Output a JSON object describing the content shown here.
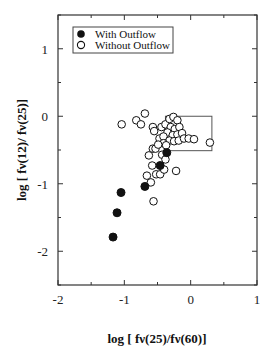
{
  "chart_data": {
    "type": "scatter",
    "title": "",
    "xlabel": "log [ fν(25)/fν(60)]",
    "ylabel": "log [ fν(12)/ fν(25)]",
    "xlim": [
      -2,
      1
    ],
    "ylim": [
      -2.5,
      1.5
    ],
    "xticks": [
      -2,
      -1,
      0,
      1
    ],
    "yticks": [
      -2,
      -1,
      0,
      1
    ],
    "grid": false,
    "legend_position": "upper left",
    "legend": [
      "With Outflow",
      "Without Outflow"
    ],
    "annotations": [
      {
        "type": "rectangle",
        "x0": -0.38,
        "x1": 0.32,
        "y0": -0.51,
        "y1": 0.0
      }
    ],
    "series": [
      {
        "name": "With Outflow",
        "marker": "filled-circle",
        "points": [
          [
            -0.36,
            -0.54
          ],
          [
            -0.46,
            -0.73
          ],
          [
            -0.69,
            -1.04
          ],
          [
            -1.05,
            -1.13
          ],
          [
            -1.11,
            -1.43
          ],
          [
            -1.17,
            -1.79
          ]
        ]
      },
      {
        "name": "Without Outflow",
        "marker": "open-circle",
        "points": [
          [
            -1.04,
            -0.12
          ],
          [
            -0.82,
            -0.06
          ],
          [
            -0.75,
            -0.12
          ],
          [
            -0.69,
            0.04
          ],
          [
            -0.57,
            -0.16
          ],
          [
            -0.55,
            -0.22
          ],
          [
            -0.47,
            -0.33
          ],
          [
            -0.57,
            -0.48
          ],
          [
            -0.53,
            -0.48
          ],
          [
            -0.44,
            -0.16
          ],
          [
            -0.38,
            -0.12
          ],
          [
            -0.32,
            -0.04
          ],
          [
            -0.26,
            -0.01
          ],
          [
            -0.2,
            -0.06
          ],
          [
            -0.3,
            -0.16
          ],
          [
            -0.24,
            -0.19
          ],
          [
            -0.17,
            -0.16
          ],
          [
            -0.35,
            -0.24
          ],
          [
            -0.27,
            -0.28
          ],
          [
            -0.2,
            -0.27
          ],
          [
            -0.13,
            -0.25
          ],
          [
            -0.41,
            -0.3
          ],
          [
            -0.32,
            -0.36
          ],
          [
            -0.25,
            -0.37
          ],
          [
            -0.18,
            -0.36
          ],
          [
            -0.1,
            -0.33
          ],
          [
            -0.03,
            -0.33
          ],
          [
            0.05,
            -0.34
          ],
          [
            0.29,
            -0.39
          ],
          [
            -0.41,
            -0.4
          ],
          [
            -0.37,
            -0.43
          ],
          [
            -0.49,
            -0.42
          ],
          [
            -0.43,
            -0.57
          ],
          [
            -0.63,
            -0.58
          ],
          [
            -0.38,
            -0.64
          ],
          [
            -0.58,
            -0.73
          ],
          [
            -0.52,
            -0.86
          ],
          [
            -0.46,
            -0.86
          ],
          [
            -0.4,
            -0.79
          ],
          [
            -0.22,
            -0.81
          ],
          [
            -0.66,
            -0.88
          ],
          [
            -0.6,
            -0.98
          ],
          [
            -0.56,
            -1.26
          ]
        ]
      }
    ]
  }
}
